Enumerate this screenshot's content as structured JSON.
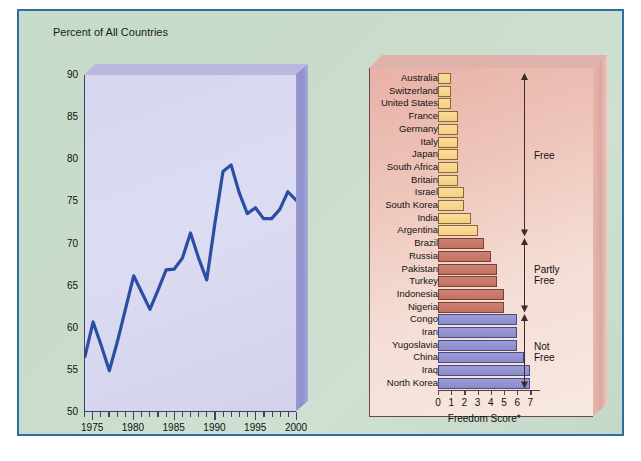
{
  "figure": {
    "border_color": "#2f6f9f",
    "background": "#c9dccb"
  },
  "chart_data": [
    {
      "type": "line",
      "title": "Percent of All Countries",
      "xlabel": "",
      "ylabel": "Percent of All Countries",
      "xlim": [
        1974,
        2000
      ],
      "ylim": [
        50,
        90
      ],
      "ytick_labels": [
        "90",
        "85",
        "80",
        "75",
        "70",
        "65",
        "60",
        "55",
        "50"
      ],
      "ytick_values": [
        90,
        85,
        80,
        75,
        70,
        65,
        60,
        55,
        50
      ],
      "xtick_labels": [
        "1975",
        "1980",
        "1985",
        "1990",
        "1995",
        "2000"
      ],
      "xtick_values": [
        1975,
        1980,
        1985,
        1990,
        1995,
        2000
      ],
      "grid": false,
      "legend": "none",
      "line_color": "#2b4ea2",
      "x": [
        1974,
        1975,
        1976,
        1977,
        1978,
        1979,
        1980,
        1981,
        1982,
        1983,
        1984,
        1985,
        1986,
        1987,
        1988,
        1989,
        1990,
        1991,
        1992,
        1993,
        1994,
        1995,
        1996,
        1997,
        1998,
        1999,
        2000
      ],
      "values": [
        56.5,
        60.6,
        57.8,
        54.8,
        58.3,
        62.2,
        66.1,
        64.1,
        62.1,
        64.4,
        66.8,
        66.9,
        68.2,
        71.2,
        68.2,
        65.6,
        72.3,
        78.5,
        79.3,
        76.0,
        73.5,
        74.2,
        72.9,
        72.9,
        74.0,
        76.1,
        75.1
      ]
    },
    {
      "type": "bar",
      "orientation": "horizontal",
      "title": "",
      "xlabel": "Freedom Score*",
      "ylabel": "",
      "xlim": [
        0,
        7.5
      ],
      "xtick_labels": [
        "0",
        "1",
        "2",
        "3",
        "4",
        "5",
        "6",
        "7"
      ],
      "xtick_values": [
        0,
        1,
        2,
        3,
        4,
        5,
        6,
        7
      ],
      "grid": false,
      "categories": [
        "Australia",
        "Switzerland",
        "United States",
        "France",
        "Germany",
        "Italy",
        "Japan",
        "South Africa",
        "Britain",
        "Israel",
        "South Korea",
        "India",
        "Argentina",
        "Brazil",
        "Russia",
        "Pakistan",
        "Turkey",
        "Indonesia",
        "Nigeria",
        "Congo",
        "Iran",
        "Yugoslavia",
        "China",
        "Iraq",
        "North Korea"
      ],
      "values": [
        1.0,
        1.0,
        1.0,
        1.5,
        1.5,
        1.5,
        1.5,
        1.5,
        1.5,
        2.0,
        2.0,
        2.5,
        3.0,
        3.5,
        4.0,
        4.5,
        4.5,
        5.0,
        5.0,
        6.0,
        6.0,
        6.0,
        6.5,
        7.0,
        7.0
      ],
      "groups": [
        "free",
        "free",
        "free",
        "free",
        "free",
        "free",
        "free",
        "free",
        "free",
        "free",
        "free",
        "free",
        "free",
        "partly",
        "partly",
        "partly",
        "partly",
        "partly",
        "partly",
        "notfree",
        "notfree",
        "notfree",
        "notfree",
        "notfree",
        "notfree"
      ],
      "group_labels": [
        "Free",
        "Partly\nFree",
        "Not\nFree"
      ],
      "colors": {
        "free": "#f7cf83",
        "partly": "#c8796a",
        "notfree": "#9292d0"
      }
    }
  ]
}
